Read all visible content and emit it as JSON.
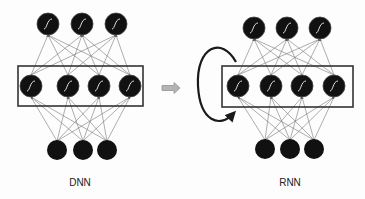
{
  "figure": {
    "panels": [
      {
        "id": "dnn",
        "label": "DNN",
        "output_layer": {
          "count": 3,
          "activation": "sigmoid"
        },
        "hidden_layer": {
          "count": 4,
          "activation": "sigmoid",
          "boxed": true
        },
        "input_layer": {
          "count": 3
        },
        "recurrent_loop": false
      },
      {
        "id": "rnn",
        "label": "RNN",
        "output_layer": {
          "count": 3,
          "activation": "sigmoid"
        },
        "hidden_layer": {
          "count": 4,
          "activation": "sigmoid",
          "boxed": true
        },
        "input_layer": {
          "count": 3
        },
        "recurrent_loop": true
      }
    ],
    "transition_arrow": {
      "direction": "right",
      "color": "#a8a8a8"
    },
    "colors": {
      "neuron_fill": "#111111",
      "sigmoid_stroke": "#dcdcdc",
      "edge": "#777777",
      "box_stroke": "#333333",
      "loop_arrow": "#1a1a1a"
    }
  }
}
